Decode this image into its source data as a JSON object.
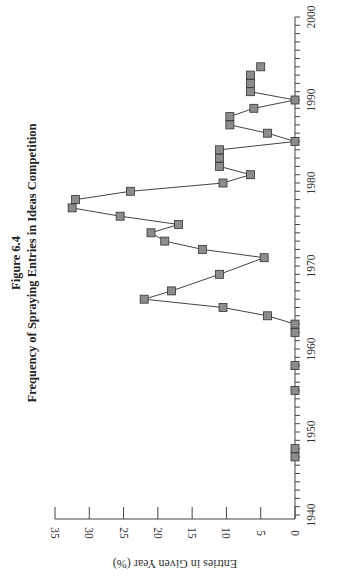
{
  "figure_label": "Figure 6.4",
  "title": "Frequency of Spraying Entries in Ideas Competition",
  "chart_data": {
    "type": "line",
    "orientation": "rotated 90 degrees clockwise (years run bottom-to-top on right edge, values increase leftward)",
    "title": "Frequency of Spraying Entries in Ideas Competition",
    "subtitle": "Figure 6.4",
    "xlabel": "",
    "ylabel": "Entries in Given Year (%)",
    "xlim": [
      1940,
      2000
    ],
    "ylim": [
      0,
      35
    ],
    "x_ticks": [
      1940,
      1950,
      1960,
      1970,
      1980,
      1990,
      2000
    ],
    "y_ticks": [
      0,
      5,
      10,
      15,
      20,
      25,
      30,
      35
    ],
    "grid": false,
    "legend": null,
    "marker": "square",
    "marker_color": "#8c8c8c",
    "line_color": "#444444",
    "series": [
      {
        "name": "Unconnected early entries",
        "connected": false,
        "x": [
          1947,
          1948,
          1955,
          1958
        ],
        "values": [
          0,
          0,
          0,
          0
        ]
      },
      {
        "name": "Spraying entries",
        "connected": true,
        "x": [
          1962,
          1963,
          1964,
          1965,
          1966,
          1967,
          1969,
          1971,
          1972,
          1973,
          1974,
          1975,
          1976,
          1977,
          1978,
          1979,
          1980,
          1981,
          1982,
          1983,
          1984,
          1985,
          1986,
          1987,
          1988,
          1989,
          1990,
          1991,
          1992,
          1993
        ],
        "values": [
          0,
          0,
          4,
          10.5,
          22,
          18,
          11,
          4.5,
          13.5,
          19,
          21,
          17,
          25.5,
          32.5,
          32,
          24,
          10.5,
          6.5,
          11,
          11,
          11,
          0,
          4,
          9.5,
          9.5,
          6,
          0,
          6.5,
          6.5,
          6.5
        ]
      },
      {
        "name": "Unconnected late entry",
        "connected": false,
        "x": [
          1994
        ],
        "values": [
          5
        ]
      }
    ]
  }
}
